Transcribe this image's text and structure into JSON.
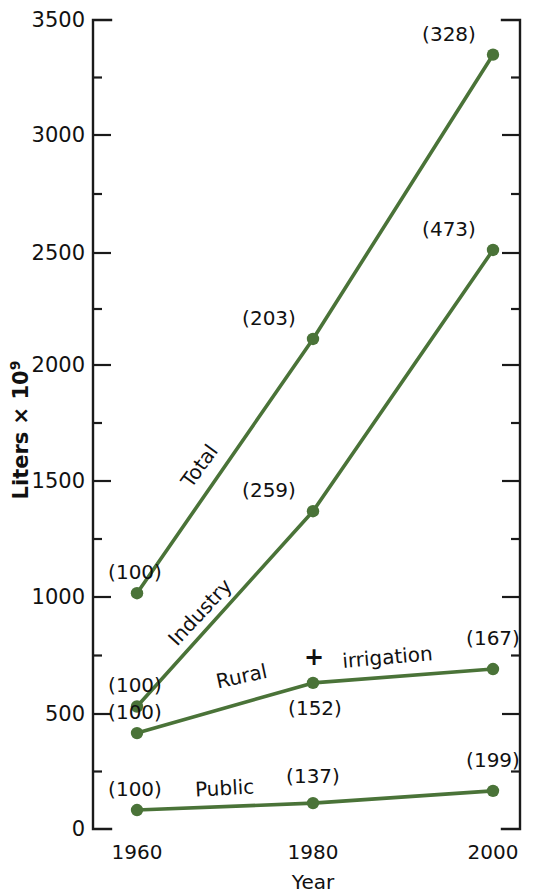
{
  "chart_data": {
    "type": "line",
    "title": "",
    "xlabel": "Year",
    "ylabel": "Liters × 10⁹",
    "ylabel_base": "Liters × 10",
    "ylabel_exponent": "9",
    "x": [
      1960,
      1980,
      2000
    ],
    "xticklabels": [
      "1960",
      "1980",
      "2000"
    ],
    "yticklabels": [
      "0",
      "500",
      "1000",
      "1500",
      "2000",
      "2500",
      "3000",
      "3500"
    ],
    "ytickvalues": [
      0,
      500,
      1000,
      1500,
      2000,
      2500,
      3000,
      3500
    ],
    "ylim": [
      0,
      3500
    ],
    "xlim": [
      1955,
      2005
    ],
    "grid": false,
    "legend": "inline-labels",
    "minor_ticks": true,
    "series_color": "#4a7338",
    "axis_color": "#1a1a1a",
    "series": [
      {
        "name": "Total",
        "label": "Total",
        "values": [
          1020,
          2120,
          3350
        ],
        "index_labels": [
          "(100)",
          "(203)",
          "(328)"
        ]
      },
      {
        "name": "Industry",
        "label": "Industry",
        "values": [
          530,
          1375,
          2505
        ],
        "index_labels": [
          "(100)",
          "(259)",
          "(473)"
        ]
      },
      {
        "name": "Rural + irrigation",
        "label": "Rural",
        "label_extra": "irrigation",
        "label_plus": "+",
        "values": [
          415,
          632,
          692
        ],
        "index_labels": [
          "(100)",
          "(152)",
          "(167)"
        ]
      },
      {
        "name": "Public",
        "label": "Public",
        "values": [
          82,
          112,
          165
        ],
        "index_labels": [
          "(100)",
          "(137)",
          "(199)"
        ]
      }
    ]
  },
  "axis": {
    "y_ticks": [
      {
        "label": "3500",
        "y": 20
      },
      {
        "label": "3000",
        "y": 135
      },
      {
        "label": "2500",
        "y": 253
      },
      {
        "label": "2000",
        "y": 365
      },
      {
        "label": "1500",
        "y": 481
      },
      {
        "label": "1000",
        "y": 597
      },
      {
        "label": "500",
        "y": 714
      },
      {
        "label": "0",
        "y": 829
      }
    ],
    "x_ticks": [
      {
        "label": "1960",
        "x": 137
      },
      {
        "label": "1980",
        "x": 313
      },
      {
        "label": "2000",
        "x": 493
      }
    ]
  }
}
